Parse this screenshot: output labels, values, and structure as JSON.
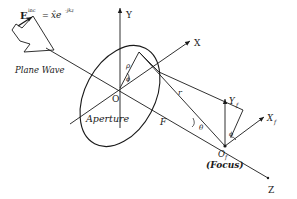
{
  "diagram": {
    "incident_field": {
      "lhs": "E",
      "superscript": "inc",
      "equals": "=",
      "rhs_base": "x̂e",
      "rhs_exponent": "-jkz"
    },
    "plane_wave_label": "Plane Wave",
    "aperture_label": "Aperture",
    "axes": {
      "y": "Y",
      "x": "X",
      "z": "Z",
      "y_focal": "Y",
      "y_focal_sub": "f",
      "x_focal": "X",
      "x_focal_sub": "f"
    },
    "points": {
      "origin": "O",
      "focal_origin": "O",
      "focal_origin_sub": "f",
      "focus_label": "(Focus)"
    },
    "symbols": {
      "rho": "ρ",
      "phi": "ϕ",
      "phi_focal": "ϕ",
      "theta": "θ",
      "r": "r",
      "F": "F"
    }
  }
}
